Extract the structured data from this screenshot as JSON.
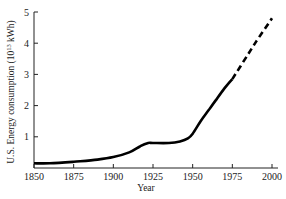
{
  "chart_data": {
    "type": "line",
    "title": "",
    "xlabel": "Year",
    "ylabel": "U.S. Energy consumption (10^13 kWh)",
    "ylabel_parts": {
      "pre": "U.S. Energy consumption (10",
      "sup": "13",
      "post": " kWh)"
    },
    "xlim": [
      1850,
      2000
    ],
    "ylim": [
      0,
      5
    ],
    "xticks": [
      1850,
      1875,
      1900,
      1925,
      1950,
      1975,
      2000
    ],
    "yticks": [
      1,
      2,
      3,
      4,
      5
    ],
    "grid": false,
    "legend": null,
    "series": [
      {
        "name": "Historical (solid)",
        "style": "solid",
        "x": [
          1850,
          1860,
          1875,
          1890,
          1900,
          1910,
          1917,
          1922,
          1925,
          1935,
          1942,
          1947,
          1950,
          1955,
          1960,
          1965,
          1970,
          1975
        ],
        "values": [
          0.15,
          0.15,
          0.2,
          0.27,
          0.35,
          0.5,
          0.7,
          0.8,
          0.8,
          0.8,
          0.85,
          0.95,
          1.1,
          1.5,
          1.85,
          2.2,
          2.55,
          2.85
        ]
      },
      {
        "name": "Projection (dashed)",
        "style": "dashed",
        "x": [
          1975,
          1985,
          1990,
          2000
        ],
        "values": [
          2.85,
          3.65,
          4.05,
          4.8
        ]
      }
    ]
  }
}
